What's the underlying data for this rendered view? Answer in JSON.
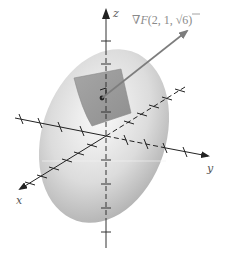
{
  "figure": {
    "type": "ellipsoid-tangent-plane-gradient",
    "labels": {
      "z_axis": "z",
      "y_axis": "y",
      "x_axis": "x",
      "gradient_prefix": "∇",
      "gradient_func": "F",
      "gradient_args_open": "(2, 1, ",
      "gradient_sqrt": "√",
      "gradient_sqrt_arg": "6",
      "gradient_args_close": ")"
    },
    "colors": {
      "surface_light": "#f2f2f2",
      "surface_dark": "#a8a8a8",
      "tangent_plane": "#9a9a9a",
      "gradient_arrow": "#7d7d7d",
      "axes": "#222222",
      "label": "#8a8a8a"
    },
    "point": {
      "name": "point-of-tangency",
      "x": 2,
      "y": 1,
      "z": "√6"
    }
  }
}
